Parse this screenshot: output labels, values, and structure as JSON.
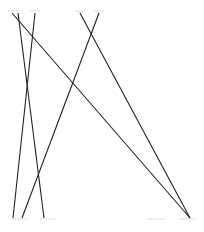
{
  "diagram": {
    "type": "bipartite-crossing-lines",
    "stroke_color": "#222222",
    "label_color": "#b0b0b0",
    "top_nodes": [
      {
        "id": "t1",
        "x": 14,
        "y": 13,
        "label_x1": 8,
        "label_x2": 20
      },
      {
        "id": "t2",
        "x": 35,
        "y": 13,
        "label_x1": 30,
        "label_x2": 40
      },
      {
        "id": "t3",
        "x": 80,
        "y": 13,
        "label_x1": 76,
        "label_x2": 86
      },
      {
        "id": "t4",
        "x": 99,
        "y": 13,
        "label_x1": 94,
        "label_x2": 104
      }
    ],
    "bottom_nodes": [
      {
        "id": "b1",
        "x": 16,
        "y": 218,
        "label_x1": 12,
        "label_x2": 28
      },
      {
        "id": "b2",
        "x": 44,
        "y": 218,
        "label_x1": 40,
        "label_x2": 56
      },
      {
        "id": "b3",
        "x": 156,
        "y": 218,
        "label_x1": 148,
        "label_x2": 165
      },
      {
        "id": "b4",
        "x": 190,
        "y": 218,
        "label_x1": 180,
        "label_x2": 196
      }
    ],
    "edges": [
      {
        "x1": 12,
        "y1": 13,
        "x2": 190,
        "y2": 218
      },
      {
        "x1": 18,
        "y1": 13,
        "x2": 44,
        "y2": 218
      },
      {
        "x1": 35,
        "y1": 13,
        "x2": 13,
        "y2": 218
      },
      {
        "x1": 80,
        "y1": 13,
        "x2": 190,
        "y2": 218
      },
      {
        "x1": 99,
        "y1": 13,
        "x2": 22,
        "y2": 218
      }
    ]
  }
}
